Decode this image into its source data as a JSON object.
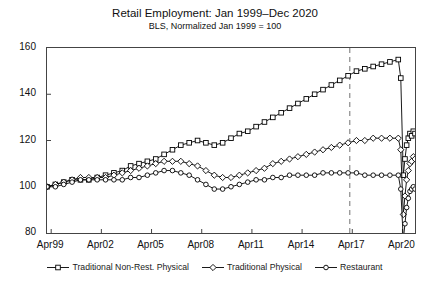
{
  "chart_data": {
    "type": "line",
    "title": "Retail Employment: Jan 1999–Dec 2020",
    "subtitle": "BLS, Normalized Jan 1999 = 100",
    "xlabel": "",
    "ylabel": "",
    "ylim": [
      80,
      160
    ],
    "yticks": [
      80,
      100,
      120,
      140,
      160
    ],
    "xticks": [
      "Apr99",
      "Apr02",
      "Apr05",
      "Apr08",
      "Apr11",
      "Apr14",
      "Apr17",
      "Apr20"
    ],
    "xlim_years": [
      1999.0,
      2021.0
    ],
    "xtick_years": [
      1999.25,
      2002.25,
      2005.25,
      2008.25,
      2011.25,
      2014.25,
      2017.25,
      2020.25
    ],
    "grid": false,
    "legend_position": "below",
    "annotations": [
      {
        "name": "reference-line",
        "type": "vertical-dashed",
        "x_year": 2017.1,
        "color": "#8a8a8a"
      }
    ],
    "series": [
      {
        "name": "Traditional Non-Rest. Physical",
        "marker": "square",
        "color": "#000000",
        "x": [
          1999.0,
          1999.5,
          2000.0,
          2000.5,
          2001.0,
          2001.5,
          2002.0,
          2002.5,
          2003.0,
          2003.5,
          2004.0,
          2004.5,
          2005.0,
          2005.5,
          2006.0,
          2006.5,
          2007.0,
          2007.5,
          2008.0,
          2008.5,
          2009.0,
          2009.5,
          2010.0,
          2010.5,
          2011.0,
          2011.5,
          2012.0,
          2012.5,
          2013.0,
          2013.5,
          2014.0,
          2014.5,
          2015.0,
          2015.5,
          2016.0,
          2016.5,
          2017.0,
          2017.5,
          2018.0,
          2018.5,
          2019.0,
          2019.5,
          2020.0,
          2020.15,
          2020.3,
          2020.4,
          2020.5,
          2020.6,
          2020.7,
          2020.8,
          2020.9,
          2021.0
        ],
        "y": [
          100,
          101,
          102,
          103,
          103,
          103,
          104,
          105,
          106,
          107,
          109,
          110,
          111,
          112,
          114,
          116,
          118,
          119,
          120,
          119,
          118,
          119,
          121,
          123,
          124,
          126,
          128,
          130,
          132,
          134,
          136,
          138,
          140,
          142,
          144,
          146,
          148,
          150,
          151,
          152,
          153,
          154,
          155,
          147,
          105,
          112,
          118,
          121,
          123,
          122,
          124,
          123
        ]
      },
      {
        "name": "Traditional Physical",
        "marker": "diamond",
        "color": "#000000",
        "x": [
          1999.0,
          1999.5,
          2000.0,
          2000.5,
          2001.0,
          2001.5,
          2002.0,
          2002.5,
          2003.0,
          2003.5,
          2004.0,
          2004.5,
          2005.0,
          2005.5,
          2006.0,
          2006.5,
          2007.0,
          2007.5,
          2008.0,
          2008.5,
          2009.0,
          2009.5,
          2010.0,
          2010.5,
          2011.0,
          2011.5,
          2012.0,
          2012.5,
          2013.0,
          2013.5,
          2014.0,
          2014.5,
          2015.0,
          2015.5,
          2016.0,
          2016.5,
          2017.0,
          2017.5,
          2018.0,
          2018.5,
          2019.0,
          2019.5,
          2020.0,
          2020.15,
          2020.3,
          2020.4,
          2020.5,
          2020.6,
          2020.7,
          2020.8,
          2020.9,
          2021.0
        ],
        "y": [
          100,
          101,
          102,
          103,
          104,
          104,
          104,
          104,
          105,
          106,
          107,
          108,
          109,
          110,
          111,
          111,
          111,
          110,
          109,
          107,
          105,
          104,
          104,
          105,
          106,
          107,
          108,
          110,
          111,
          112,
          113,
          114,
          115,
          116,
          117,
          118,
          119,
          120,
          120,
          121,
          121,
          121,
          121,
          116,
          88,
          96,
          103,
          107,
          110,
          111,
          113,
          112
        ]
      },
      {
        "name": "Restaurant",
        "marker": "circle",
        "color": "#000000",
        "x": [
          1999.0,
          1999.5,
          2000.0,
          2000.5,
          2001.0,
          2001.5,
          2002.0,
          2002.5,
          2003.0,
          2003.5,
          2004.0,
          2004.5,
          2005.0,
          2005.5,
          2006.0,
          2006.5,
          2007.0,
          2007.5,
          2008.0,
          2008.5,
          2009.0,
          2009.5,
          2010.0,
          2010.5,
          2011.0,
          2011.5,
          2012.0,
          2012.5,
          2013.0,
          2013.5,
          2014.0,
          2014.5,
          2015.0,
          2015.5,
          2016.0,
          2016.5,
          2017.0,
          2017.5,
          2018.0,
          2018.5,
          2019.0,
          2019.5,
          2020.0,
          2020.15,
          2020.3,
          2020.4,
          2020.5,
          2020.6,
          2020.7,
          2020.8,
          2020.9,
          2021.0
        ],
        "y": [
          100,
          100,
          101,
          102,
          103,
          103,
          103,
          103,
          103,
          103,
          104,
          104,
          105,
          106,
          107,
          107,
          106,
          105,
          103,
          101,
          99,
          99,
          100,
          101,
          102,
          103,
          103,
          104,
          104,
          105,
          105,
          105,
          105,
          106,
          106,
          106,
          106,
          106,
          105,
          105,
          105,
          105,
          105,
          99,
          77,
          84,
          91,
          95,
          98,
          99,
          100,
          99
        ]
      }
    ]
  },
  "legend": {
    "items": [
      {
        "label": "Traditional Non-Rest. Physical",
        "marker": "square"
      },
      {
        "label": "Traditional Physical",
        "marker": "diamond"
      },
      {
        "label": "Restaurant",
        "marker": "circle"
      }
    ]
  }
}
